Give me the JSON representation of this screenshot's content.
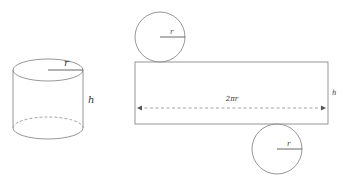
{
  "diagram": {
    "colors": {
      "stroke": "#8a8a8a",
      "dash": "#9a9a9a",
      "text": "#333333",
      "background": "#ffffff"
    },
    "cylinder": {
      "radius_label": "r",
      "height_label": "h"
    },
    "net": {
      "top_circle": {
        "radius_label": "r"
      },
      "rectangle": {
        "width_label": "2πr",
        "height_label": "h"
      },
      "bottom_circle": {
        "radius_label": "r"
      }
    }
  }
}
